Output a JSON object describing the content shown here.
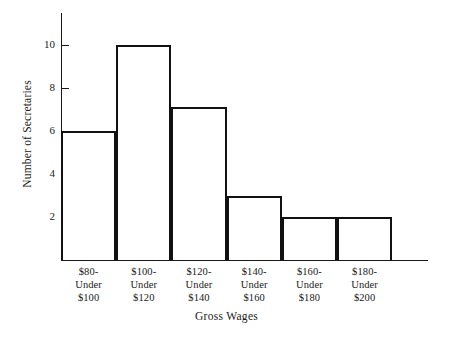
{
  "chart_data": {
    "type": "bar",
    "title": "",
    "xlabel": "Gross Wages",
    "ylabel": "Number of Secretaries",
    "categories": [
      "$80-\nUnder\n$100",
      "$100-\nUnder\n$120",
      "$120-\nUnder\n$140",
      "$140-\nUnder\n$160",
      "$160-\nUnder\n$180",
      "$180-\nUnder\n$200"
    ],
    "category_lines": [
      [
        "$80-",
        "Under",
        "$100"
      ],
      [
        "$100-",
        "Under",
        "$120"
      ],
      [
        "$120-",
        "Under",
        "$140"
      ],
      [
        "$140-",
        "Under",
        "$160"
      ],
      [
        "$160-",
        "Under",
        "$180"
      ],
      [
        "$180-",
        "Under",
        "$200"
      ]
    ],
    "values": [
      6,
      10,
      7.1,
      3,
      2,
      2
    ],
    "ytick_labels": [
      "2",
      "4",
      "6",
      "8",
      "10"
    ],
    "ytick_values": [
      2,
      4,
      6,
      8,
      10
    ],
    "ylim": [
      0,
      11.5
    ],
    "xlim_bins": 6,
    "grid": false,
    "legend": null,
    "bar_color": "#ffffff",
    "bar_edge_color": "#111111",
    "axis_color": "#1a1a1a",
    "background": "#ffffff"
  }
}
